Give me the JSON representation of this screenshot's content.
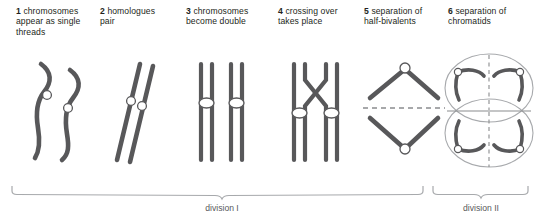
{
  "figure": {
    "stroke_color": "#58585a",
    "centromere_fill": "#ffffff",
    "cell_outline_color": "#a7a9ac",
    "bracket_color": "#a7a9ac",
    "text_color": "#231f20",
    "bracket_text_color": "#58595b",
    "background": "#ffffff"
  },
  "stages": [
    {
      "number": "1",
      "label": "chromosomes appear as single threads",
      "icon": "single-threads-icon"
    },
    {
      "number": "2",
      "label": "homologues pair",
      "icon": "paired-homologues-icon"
    },
    {
      "number": "3",
      "label": "chromosomes become double",
      "icon": "double-chromosomes-icon"
    },
    {
      "number": "4",
      "label": "crossing over takes place",
      "icon": "crossing-over-icon"
    },
    {
      "number": "5",
      "label": "separation of half-bivalents",
      "icon": "half-bivalent-separation-icon"
    },
    {
      "number": "6",
      "label": "separation of chromatids",
      "icon": "chromatid-separation-icon"
    }
  ],
  "brackets": [
    {
      "label": "division I"
    },
    {
      "label": "division II"
    }
  ]
}
